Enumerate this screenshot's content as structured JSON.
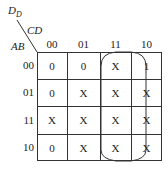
{
  "title": {
    "main": "D",
    "subscript": "D"
  },
  "axis_labels": {
    "columns_var": "CD",
    "rows_var": "AB"
  },
  "column_headers": [
    "00",
    "01",
    "11",
    "10"
  ],
  "row_headers": [
    "00",
    "01",
    "11",
    "10"
  ],
  "cells": [
    [
      "0",
      "0",
      "X",
      "1"
    ],
    [
      "0",
      "X",
      "X",
      "X"
    ],
    [
      "X",
      "X",
      "X",
      "X"
    ],
    [
      "0",
      "X",
      "X",
      "X"
    ]
  ],
  "grouping": {
    "description": "Loop enclosing columns CD=11 and CD=10 across all rows"
  }
}
